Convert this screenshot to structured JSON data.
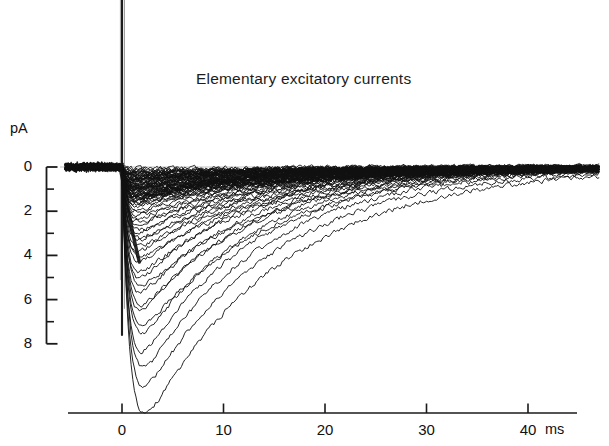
{
  "chart_data": {
    "type": "line",
    "title": "Elementary excitatory currents",
    "xlabel": "ms",
    "ylabel": "pA",
    "xlim": [
      -5.5,
      47.0
    ],
    "ylim": [
      8.6,
      -0.9
    ],
    "y_axis_inverted": true,
    "grid": false,
    "legend": false,
    "x_ticks": [
      0,
      10,
      20,
      30,
      40
    ],
    "x_tick_labels": [
      "0",
      "10",
      "20",
      "30",
      "40"
    ],
    "y_ticks": [
      0,
      2,
      4,
      6,
      8
    ],
    "y_tick_labels": [
      "0",
      "2",
      "4",
      "6",
      "8"
    ],
    "y_minor_ticks": [
      1,
      3,
      5,
      7
    ],
    "stimulus_artifact": {
      "time_ms": 0.0,
      "label": "stimulus artifact"
    },
    "baseline_pA": 0,
    "trace_window_ms": [
      -5.5,
      47.0
    ],
    "series": [
      {
        "name": "trace-01",
        "peak_pA": 7.9,
        "peak_time_ms": 7.6,
        "rise_time_ms": 1.4,
        "decay_tau_ms": 13.5
      },
      {
        "name": "trace-02",
        "peak_pA": 7.2,
        "peak_time_ms": 6.9,
        "rise_time_ms": 1.3,
        "decay_tau_ms": 12.8
      },
      {
        "name": "trace-03",
        "peak_pA": 6.8,
        "peak_time_ms": 6.2,
        "rise_time_ms": 1.3,
        "decay_tau_ms": 12.0
      },
      {
        "name": "trace-04",
        "peak_pA": 6.4,
        "peak_time_ms": 5.6,
        "rise_time_ms": 1.2,
        "decay_tau_ms": 11.5
      },
      {
        "name": "trace-05",
        "peak_pA": 6.1,
        "peak_time_ms": 4.9,
        "rise_time_ms": 1.2,
        "decay_tau_ms": 11.2
      },
      {
        "name": "trace-06",
        "peak_pA": 5.7,
        "peak_time_ms": 5.4,
        "rise_time_ms": 1.2,
        "decay_tau_ms": 12.4
      },
      {
        "name": "trace-07",
        "peak_pA": 5.4,
        "peak_time_ms": 4.4,
        "rise_time_ms": 1.1,
        "decay_tau_ms": 10.8
      },
      {
        "name": "trace-08",
        "peak_pA": 5.1,
        "peak_time_ms": 4.8,
        "rise_time_ms": 1.1,
        "decay_tau_ms": 11.8
      },
      {
        "name": "trace-09",
        "peak_pA": 4.8,
        "peak_time_ms": 4.2,
        "rise_time_ms": 1.1,
        "decay_tau_ms": 11.0
      },
      {
        "name": "trace-10",
        "peak_pA": 4.5,
        "peak_time_ms": 4.6,
        "rise_time_ms": 1.1,
        "decay_tau_ms": 12.6
      },
      {
        "name": "trace-11",
        "peak_pA": 4.3,
        "peak_time_ms": 3.8,
        "rise_time_ms": 1.0,
        "decay_tau_ms": 10.4
      },
      {
        "name": "trace-12",
        "peak_pA": 4.0,
        "peak_time_ms": 4.3,
        "rise_time_ms": 1.0,
        "decay_tau_ms": 12.0
      },
      {
        "name": "trace-13",
        "peak_pA": 3.8,
        "peak_time_ms": 3.5,
        "rise_time_ms": 1.0,
        "decay_tau_ms": 11.3
      },
      {
        "name": "trace-14",
        "peak_pA": 3.6,
        "peak_time_ms": 3.9,
        "rise_time_ms": 1.0,
        "decay_tau_ms": 12.8
      },
      {
        "name": "trace-15",
        "peak_pA": 3.4,
        "peak_time_ms": 3.3,
        "rise_time_ms": 0.9,
        "decay_tau_ms": 10.6
      },
      {
        "name": "trace-16",
        "peak_pA": 3.2,
        "peak_time_ms": 3.7,
        "rise_time_ms": 0.9,
        "decay_tau_ms": 13.2
      },
      {
        "name": "trace-17",
        "peak_pA": 3.0,
        "peak_time_ms": 3.1,
        "rise_time_ms": 0.9,
        "decay_tau_ms": 11.0
      },
      {
        "name": "trace-18",
        "peak_pA": 2.9,
        "peak_time_ms": 3.5,
        "rise_time_ms": 0.9,
        "decay_tau_ms": 13.6
      },
      {
        "name": "trace-19",
        "peak_pA": 2.7,
        "peak_time_ms": 2.9,
        "rise_time_ms": 0.8,
        "decay_tau_ms": 11.4
      },
      {
        "name": "trace-20",
        "peak_pA": 2.6,
        "peak_time_ms": 3.3,
        "rise_time_ms": 0.8,
        "decay_tau_ms": 14.0
      },
      {
        "name": "trace-21",
        "peak_pA": 2.4,
        "peak_time_ms": 2.7,
        "rise_time_ms": 0.8,
        "decay_tau_ms": 12.2
      },
      {
        "name": "trace-22",
        "peak_pA": 2.3,
        "peak_time_ms": 3.1,
        "rise_time_ms": 0.8,
        "decay_tau_ms": 14.5
      },
      {
        "name": "trace-23",
        "peak_pA": 2.2,
        "peak_time_ms": 2.5,
        "rise_time_ms": 0.8,
        "decay_tau_ms": 12.6
      },
      {
        "name": "trace-24",
        "peak_pA": 2.0,
        "peak_time_ms": 2.9,
        "rise_time_ms": 0.7,
        "decay_tau_ms": 15.0
      },
      {
        "name": "trace-25",
        "peak_pA": 1.9,
        "peak_time_ms": 2.4,
        "rise_time_ms": 0.7,
        "decay_tau_ms": 13.0
      },
      {
        "name": "trace-26",
        "peak_pA": 1.8,
        "peak_time_ms": 2.8,
        "rise_time_ms": 0.7,
        "decay_tau_ms": 15.4
      },
      {
        "name": "trace-27",
        "peak_pA": 1.7,
        "peak_time_ms": 2.2,
        "rise_time_ms": 0.7,
        "decay_tau_ms": 13.4
      },
      {
        "name": "trace-28",
        "peak_pA": 1.6,
        "peak_time_ms": 2.6,
        "rise_time_ms": 0.7,
        "decay_tau_ms": 16.0
      },
      {
        "name": "trace-29",
        "peak_pA": 1.5,
        "peak_time_ms": 2.1,
        "rise_time_ms": 0.6,
        "decay_tau_ms": 13.8
      },
      {
        "name": "trace-30",
        "peak_pA": 1.4,
        "peak_time_ms": 2.5,
        "rise_time_ms": 0.6,
        "decay_tau_ms": 16.5
      },
      {
        "name": "trace-31",
        "peak_pA": 1.3,
        "peak_time_ms": 2.0,
        "rise_time_ms": 0.6,
        "decay_tau_ms": 14.2
      },
      {
        "name": "trace-32",
        "peak_pA": 1.25,
        "peak_time_ms": 2.4,
        "rise_time_ms": 0.6,
        "decay_tau_ms": 17.0
      },
      {
        "name": "trace-33",
        "peak_pA": 1.15,
        "peak_time_ms": 1.9,
        "rise_time_ms": 0.6,
        "decay_tau_ms": 14.6
      },
      {
        "name": "trace-34",
        "peak_pA": 1.1,
        "peak_time_ms": 2.3,
        "rise_time_ms": 0.6,
        "decay_tau_ms": 17.5
      },
      {
        "name": "trace-35",
        "peak_pA": 1.0,
        "peak_time_ms": 1.8,
        "rise_time_ms": 0.5,
        "decay_tau_ms": 15.0
      },
      {
        "name": "trace-36",
        "peak_pA": 0.95,
        "peak_time_ms": 2.2,
        "rise_time_ms": 0.5,
        "decay_tau_ms": 18.0
      },
      {
        "name": "trace-37",
        "peak_pA": 0.9,
        "peak_time_ms": 1.7,
        "rise_time_ms": 0.5,
        "decay_tau_ms": 15.5
      },
      {
        "name": "trace-38",
        "peak_pA": 0.85,
        "peak_time_ms": 2.1,
        "rise_time_ms": 0.5,
        "decay_tau_ms": 18.5
      },
      {
        "name": "trace-39",
        "peak_pA": 0.8,
        "peak_time_ms": 1.6,
        "rise_time_ms": 0.5,
        "decay_tau_ms": 16.0
      },
      {
        "name": "trace-40",
        "peak_pA": 0.75,
        "peak_time_ms": 2.0,
        "rise_time_ms": 0.5,
        "decay_tau_ms": 19.0
      },
      {
        "name": "trace-41",
        "peak_pA": 0.7,
        "peak_time_ms": 1.5,
        "rise_time_ms": 0.5,
        "decay_tau_ms": 16.5
      },
      {
        "name": "trace-42",
        "peak_pA": 0.65,
        "peak_time_ms": 1.9,
        "rise_time_ms": 0.5,
        "decay_tau_ms": 19.5
      },
      {
        "name": "trace-43",
        "peak_pA": 0.6,
        "peak_time_ms": 1.5,
        "rise_time_ms": 0.4,
        "decay_tau_ms": 17.0
      },
      {
        "name": "trace-44",
        "peak_pA": 0.55,
        "peak_time_ms": 1.8,
        "rise_time_ms": 0.4,
        "decay_tau_ms": 20.0
      },
      {
        "name": "trace-45",
        "peak_pA": 0.5,
        "peak_time_ms": 1.4,
        "rise_time_ms": 0.4,
        "decay_tau_ms": 17.5
      },
      {
        "name": "trace-46",
        "peak_pA": 0.45,
        "peak_time_ms": 1.7,
        "rise_time_ms": 0.4,
        "decay_tau_ms": 20.5
      },
      {
        "name": "trace-47",
        "peak_pA": 0.4,
        "peak_time_ms": 1.4,
        "rise_time_ms": 0.4,
        "decay_tau_ms": 18.0
      },
      {
        "name": "trace-48",
        "peak_pA": 0.35,
        "peak_time_ms": 1.6,
        "rise_time_ms": 0.4,
        "decay_tau_ms": 21.0
      },
      {
        "name": "trace-49",
        "peak_pA": 0.3,
        "peak_time_ms": 1.3,
        "rise_time_ms": 0.4,
        "decay_tau_ms": 18.5
      },
      {
        "name": "trace-50",
        "peak_pA": 0.25,
        "peak_time_ms": 1.5,
        "rise_time_ms": 0.4,
        "decay_tau_ms": 21.5
      }
    ],
    "colors": {
      "trace": "#111111",
      "axis": "#1a1a1a",
      "text": "#111111",
      "background": "#ffffff"
    }
  }
}
